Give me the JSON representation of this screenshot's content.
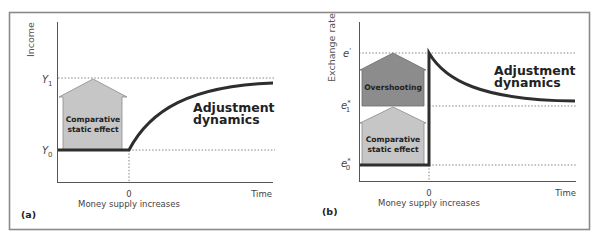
{
  "figure": {
    "panels": [
      {
        "id": "a",
        "panel_label": "(a)",
        "y_axis_title": "Income",
        "x_axis_end_label": "Time",
        "zero_label": "0",
        "event_label": "Money supply increases",
        "levels": [
          {
            "name": "Y",
            "sub": "1",
            "sup": ""
          },
          {
            "name": "Y",
            "sub": "0",
            "sup": ""
          }
        ],
        "boxes": [
          {
            "label_lines": [
              "Comparative",
              "static effect"
            ],
            "fill": "#c6c6c6"
          }
        ],
        "curve_label_lines": [
          "Adjustment",
          "dynamics"
        ]
      },
      {
        "id": "b",
        "panel_label": "(b)",
        "y_axis_title": "Exchange rate",
        "x_axis_end_label": "Time",
        "zero_label": "0",
        "event_label": "Money supply increases",
        "levels": [
          {
            "name": "e",
            "sub": "",
            "sup": "'"
          },
          {
            "name": "e",
            "sub": "1",
            "sup": "*"
          },
          {
            "name": "e",
            "sub": "0",
            "sup": "*"
          }
        ],
        "boxes": [
          {
            "label_lines": [
              "Overshooting"
            ],
            "fill": "#8c8c8c"
          },
          {
            "label_lines": [
              "Comparative",
              "static effect"
            ],
            "fill": "#c6c6c6"
          }
        ],
        "curve_label_lines": [
          "Adjustment",
          "dynamics"
        ]
      }
    ]
  },
  "colors": {
    "curve": "#2e2e2e",
    "frame": "#8a8a8a",
    "overshooting_box": "#8c8c8c",
    "comparative_box": "#c6c6c6"
  }
}
